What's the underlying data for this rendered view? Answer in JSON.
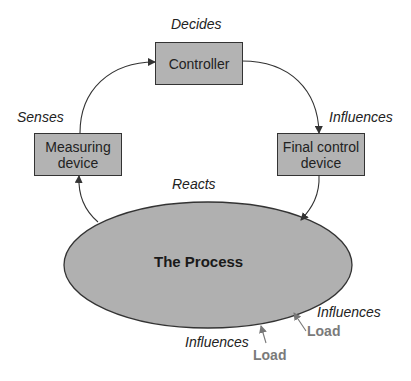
{
  "diagram": {
    "nodes": {
      "controller": {
        "label": "Controller",
        "action": "Decides"
      },
      "measuring_device": {
        "label": "Measuring\ndevice",
        "line1": "Measuring",
        "line2": "device",
        "action": "Senses"
      },
      "final_control_device": {
        "label": "Final control\ndevice",
        "line1": "Final control",
        "line2": "device",
        "action": "Influences"
      },
      "process": {
        "label": "The Process",
        "action": "Reacts"
      }
    },
    "loads": [
      {
        "label": "Load",
        "effect": "Influences"
      },
      {
        "label": "Load",
        "effect": "Influences"
      }
    ],
    "edges": [
      {
        "from": "measuring_device",
        "to": "controller"
      },
      {
        "from": "controller",
        "to": "final_control_device"
      },
      {
        "from": "final_control_device",
        "to": "process"
      },
      {
        "from": "process",
        "to": "measuring_device"
      },
      {
        "from": "load_1",
        "to": "process"
      },
      {
        "from": "load_2",
        "to": "process"
      }
    ],
    "colors": {
      "box_fill": "#b3b3b3",
      "stroke": "#333333",
      "load_text": "#7a7a7a"
    }
  }
}
